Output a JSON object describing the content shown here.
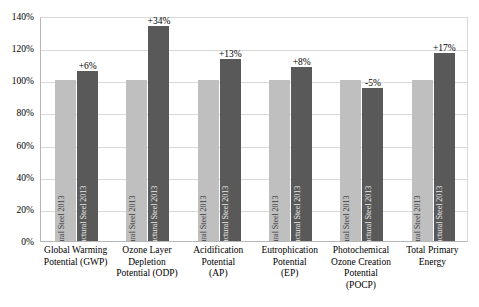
{
  "chart_data": {
    "type": "bar",
    "title": "",
    "subtitle": "",
    "xlabel": "",
    "ylabel": "",
    "ylim": [
      0,
      140
    ],
    "y_tick_labels": [
      "0%",
      "20%",
      "40%",
      "60%",
      "80%",
      "100%",
      "120%",
      "140%"
    ],
    "y_tick_values": [
      0,
      20,
      40,
      60,
      80,
      100,
      120,
      140
    ],
    "grid": true,
    "legend_position": "none",
    "categories": [
      "Global Warming Potential (GWP)",
      "Ozone Layer Depletion Potential (ODP)",
      "Acidification Potential (AP)",
      "Eutrophication Potential (EP)",
      "Photochemical Ozone Creation Potential (POCP)",
      "Total Primary Energy"
    ],
    "category_lines": [
      [
        "Global Warming",
        "Potential (GWP)"
      ],
      [
        "Ozone Layer",
        "Depletion",
        "Potential (ODP)"
      ],
      [
        "Acidification",
        "Potential",
        "(AP)"
      ],
      [
        "Eutrophication",
        "Potential",
        "(EP)"
      ],
      [
        "Photochemical",
        "Ozone Creation",
        "Potential",
        "(POCP)"
      ],
      [
        "Total Primary",
        "Energy"
      ]
    ],
    "series": [
      {
        "name": "EPD Structural Steel 2013",
        "color": "#bfbfbf",
        "values": [
          100,
          100,
          100,
          100,
          100,
          100
        ],
        "in_bar_label": "EPD Structural Steel 2013"
      },
      {
        "name": "EPD HDG Structural Steel 2013",
        "color": "#595959",
        "values": [
          106,
          134,
          113,
          108,
          95,
          117
        ],
        "in_bar_label": "EPD HDG Structural Steel 2013",
        "data_labels": [
          "+6%",
          "+34%",
          "+13%",
          "+8%",
          "-5%",
          "+17%"
        ]
      }
    ]
  },
  "axis": {
    "y_label_0": "0%",
    "y_label_20": "20%",
    "y_label_40": "40%",
    "y_label_60": "60%",
    "y_label_80": "80%",
    "y_label_100": "100%",
    "y_label_120": "120%",
    "y_label_140": "140%"
  },
  "colors": {
    "series_base": "#bfbfbf",
    "series_hdg": "#595959",
    "gridline": "#d9d9d9",
    "axis": "#b6b6b6",
    "background": "#ffffff"
  }
}
